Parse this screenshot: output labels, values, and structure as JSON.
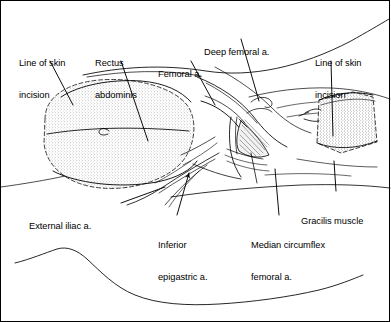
{
  "figure": {
    "name": "groin-flap-anatomy-illustration",
    "type": "line-drawing",
    "background_color": "#ffffff",
    "ink_color": "#000000",
    "stipple_fill_color": "#d8d8d8",
    "border": "1px solid #000000"
  },
  "labels": [
    {
      "id": "line-of-skin-incision-left",
      "line1": "Line of skin",
      "line2": "incision",
      "x": 18,
      "y": 36
    },
    {
      "id": "rectus-abdominis",
      "line1": "Rectus",
      "line2": "abdominis",
      "x": 94,
      "y": 36
    },
    {
      "id": "femoral-artery",
      "line1": "Femoral a.",
      "line2": "",
      "x": 157,
      "y": 47
    },
    {
      "id": "deep-femoral-artery",
      "line1": "Deep femoral a.",
      "line2": "",
      "x": 203,
      "y": 25
    },
    {
      "id": "line-of-skin-incision-right",
      "line1": "Line of skin",
      "line2": "incision",
      "x": 314,
      "y": 36
    },
    {
      "id": "external-iliac-artery",
      "line1": "External iliac a.",
      "line2": "",
      "x": 28,
      "y": 199
    },
    {
      "id": "inferior-epigastric-artery",
      "line1": "Inferior",
      "line2": "epigastric a.",
      "x": 157,
      "y": 218
    },
    {
      "id": "median-circumflex-femoral-artery",
      "line1": "Median circumflex",
      "line2": "femoral a.",
      "x": 250,
      "y": 218
    },
    {
      "id": "gracilis-muscle",
      "line1": "Gracilis muscle",
      "line2": "",
      "x": 300,
      "y": 194
    }
  ],
  "anatomy": {
    "left_flap": {
      "name": "left-skin-flap",
      "shape": "stippled-oval-dashed-border"
    },
    "right_flap": {
      "name": "right-skin-flap",
      "shape": "stippled-quadrilateral-dashed-border"
    },
    "vessels": [
      "external iliac a.",
      "inferior epigastric a.",
      "femoral a.",
      "deep femoral a.",
      "median circumflex femoral a."
    ],
    "muscles": [
      "rectus abdominis",
      "gracilis muscle"
    ],
    "bottom_contour": "limb outline"
  }
}
